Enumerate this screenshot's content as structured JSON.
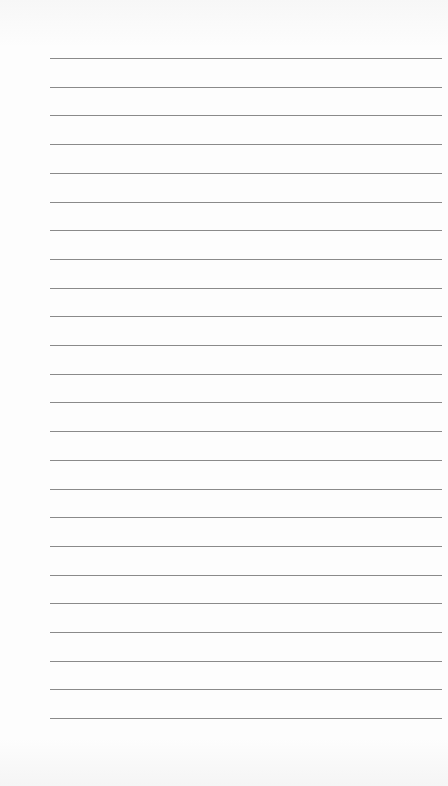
{
  "page": {
    "type": "lined-notepad",
    "background_color": "#fbfbfb",
    "rule_color": "#8a8a8a",
    "line_count": 24,
    "first_line_y": 58,
    "line_spacing": 28.7,
    "lines": [
      "",
      "",
      "",
      "",
      "",
      "",
      "",
      "",
      "",
      "",
      "",
      "",
      "",
      "",
      "",
      "",
      "",
      "",
      "",
      "",
      "",
      "",
      "",
      ""
    ]
  }
}
